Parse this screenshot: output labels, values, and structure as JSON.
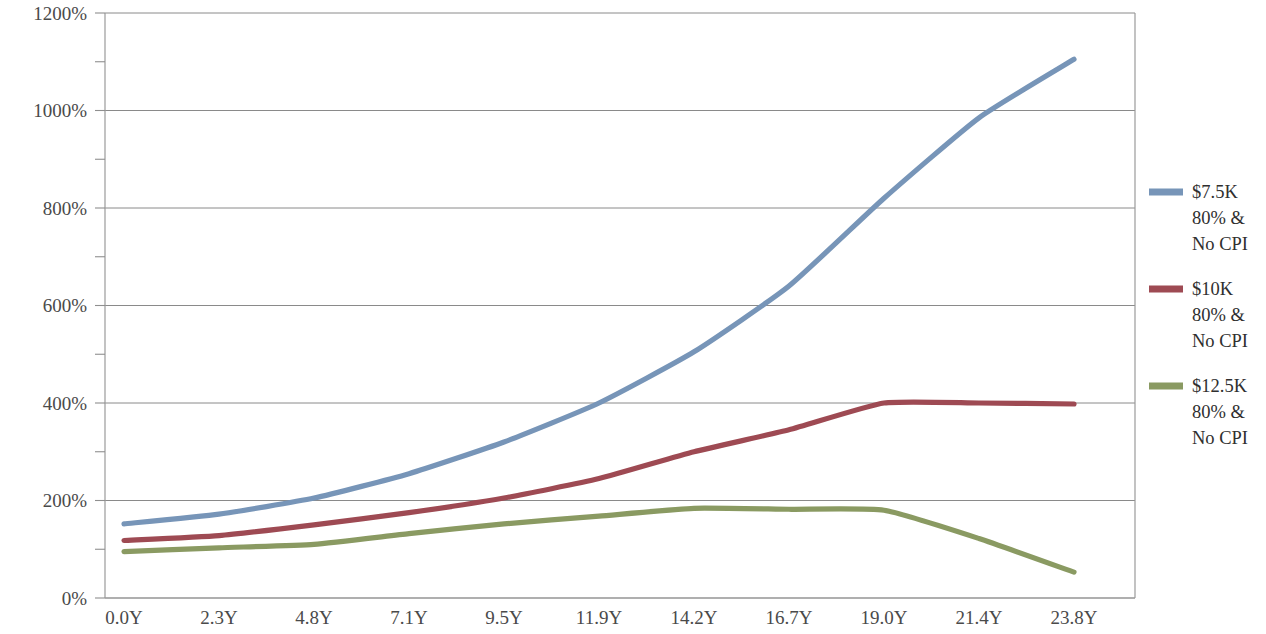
{
  "chart_data": {
    "type": "line",
    "title": "",
    "subtitle": "",
    "xlabel": "",
    "ylabel": "",
    "grid": true,
    "legend_position": "right",
    "x": [
      "0.0Y",
      "2.3Y",
      "4.8Y",
      "7.1Y",
      "9.5Y",
      "11.9Y",
      "14.2Y",
      "16.7Y",
      "19.0Y",
      "21.4Y",
      "23.8Y"
    ],
    "xtick_labels": [
      "0.0Y",
      "2.3Y",
      "4.8Y",
      "7.1Y",
      "9.5Y",
      "11.9Y",
      "14.2Y",
      "16.7Y",
      "19.0Y",
      "21.4Y",
      "23.8Y"
    ],
    "ytick_labels": [
      "0%",
      "200%",
      "400%",
      "600%",
      "800%",
      "1000%",
      "1200%"
    ],
    "ytick_values": [
      0,
      200,
      400,
      600,
      800,
      1000,
      1200
    ],
    "yminor_values": [
      100,
      300,
      500,
      700,
      900,
      1100
    ],
    "ylim": [
      0,
      1200
    ],
    "yunit": "%",
    "series": [
      {
        "name": "$7.5K 80% & No CPI",
        "legend_lines": [
          "$7.5K",
          "80% &",
          "No CPI"
        ],
        "color": "#7795b8",
        "values": [
          152,
          172,
          205,
          255,
          320,
          400,
          505,
          640,
          820,
          985,
          1105
        ]
      },
      {
        "name": "$10K 80% & No CPI",
        "legend_lines": [
          "$10K",
          "80% &",
          "No CPI"
        ],
        "color": "#9e4a53",
        "values": [
          118,
          128,
          150,
          175,
          205,
          245,
          300,
          345,
          400,
          400,
          398
        ]
      },
      {
        "name": "$12.5K 80% & No CPI",
        "legend_lines": [
          "$12.5K",
          "80% &",
          "No CPI"
        ],
        "color": "#8a9a62",
        "values": [
          95,
          103,
          110,
          132,
          152,
          168,
          184,
          182,
          180,
          122,
          53
        ]
      }
    ]
  },
  "legend": {
    "entries": [
      {
        "label_line_1": "$7.5K",
        "label_line_2": "80% &",
        "label_line_3": "No CPI",
        "color": "#7795b8"
      },
      {
        "label_line_1": "$10K",
        "label_line_2": "80% &",
        "label_line_3": "No CPI",
        "color": "#9e4a53"
      },
      {
        "label_line_1": "$12.5K",
        "label_line_2": "80% &",
        "label_line_3": "No CPI",
        "color": "#8a9a62"
      }
    ]
  },
  "colors": {
    "series_blue": "#7795b8",
    "series_red": "#9e4a53",
    "series_green": "#8a9a62",
    "gridline": "#8a8a8a",
    "axis": "#9a9a9a",
    "text": "#3a3a3a",
    "background": "#ffffff"
  }
}
